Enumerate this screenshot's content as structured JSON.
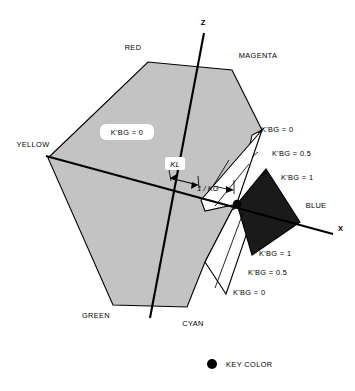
{
  "figure": {
    "background_color": "#ffffff",
    "gamut_fill_color": "#c3c3c3",
    "key_region_color": "#1a1a1a",
    "unkeyed_region_color": "#ffffff",
    "line_color": "#000000"
  },
  "axes": [
    {
      "id": "z",
      "label": "Z"
    },
    {
      "id": "x",
      "label": "X"
    }
  ],
  "hue_vertices": [
    {
      "id": "red",
      "label": "RED"
    },
    {
      "id": "magenta",
      "label": "MAGENTA"
    },
    {
      "id": "blue",
      "label": "BLUE"
    },
    {
      "id": "cyan",
      "label": "CYAN"
    },
    {
      "id": "green",
      "label": "GREEN"
    },
    {
      "id": "yellow",
      "label": "YELLOW"
    }
  ],
  "region_labels": {
    "interior": "K'BG = 0",
    "upper": [
      "K'BG = 0",
      "K'BG = 0.5",
      "K'BG = 1"
    ],
    "lower": [
      "K'BG = 1",
      "K'BG = 0.5",
      "K'BG = 0"
    ]
  },
  "parameter_labels": {
    "kl": "KL",
    "kg": "1 / KG"
  },
  "legend": {
    "items": [
      {
        "marker": "filled-circle",
        "marker_color": "#000000",
        "label": "KEY COLOR"
      }
    ]
  }
}
